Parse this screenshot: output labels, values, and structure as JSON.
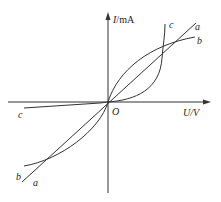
{
  "diagram": {
    "type": "I-U characteristic curves",
    "y_axis": {
      "var": "I",
      "unit": "mA",
      "label_sep": "/"
    },
    "x_axis": {
      "var": "U",
      "unit": "V",
      "label_sep": "/"
    },
    "origin_label": "O",
    "curves": [
      {
        "name": "a",
        "shape": "straight line through origin",
        "upper_label": "a",
        "lower_label": "a"
      },
      {
        "name": "b",
        "shape": "concave, saturating curve through origin",
        "upper_label": "b",
        "lower_label": "b"
      },
      {
        "name": "c",
        "shape": "diode-like: near-zero for U<0, steep rise for U>0",
        "upper_label": "c",
        "lower_label": "c"
      }
    ],
    "colors": {
      "line": "#333333",
      "background": "#ffffff"
    }
  }
}
